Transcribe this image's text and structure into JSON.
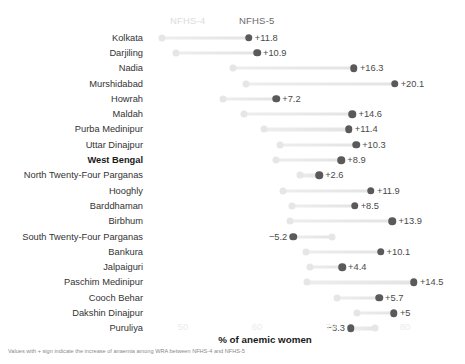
{
  "legend": {
    "nfhs4_label": "NFHS-4",
    "nfhs5_label": "NFHS-5",
    "nfhs4_color": "#e6e6e6",
    "nfhs5_color": "#5a5a5a"
  },
  "axis": {
    "title": "% of anemic women",
    "ticks": [
      "50",
      "60",
      "70",
      "80"
    ],
    "tick_values": [
      50,
      60,
      70,
      80
    ]
  },
  "footnote": "Values with + sign indicate the increase of anaemia among WRA between NFHS-4 and NFHS-5",
  "highlight_row": "West Bengal",
  "chart_data": {
    "type": "scatter",
    "subtype": "dumbbell",
    "title": "",
    "xlabel": "% of anemic women",
    "ylabel": "",
    "xlim": [
      42,
      86
    ],
    "grid": false,
    "legend_position": "top",
    "categories": [
      "Kolkata",
      "Darjiling",
      "Nadia",
      "Murshidabad",
      "Howrah",
      "Maldah",
      "Purba Medinipur",
      "Uttar Dinajpur",
      "West Bengal",
      "North Twenty-Four Parganas",
      "Hooghly",
      "Barddhaman",
      "Birbhum",
      "South Twenty-Four Parganas",
      "Bankura",
      "Jalpaiguri",
      "Paschim Medinipur",
      "Cooch Behar",
      "Dakshin Dinajpur",
      "Puruliya"
    ],
    "series": [
      {
        "name": "NFHS-4",
        "values": [
          47.1,
          49.1,
          56.8,
          58.5,
          55.4,
          58.3,
          61.0,
          63.1,
          62.5,
          65.8,
          63.5,
          64.7,
          64.4,
          70.1,
          66.6,
          67.1,
          66.7,
          70.8,
          73.5,
          76.0
        ]
      },
      {
        "name": "NFHS-5",
        "values": [
          58.9,
          60.0,
          73.1,
          78.6,
          62.6,
          72.9,
          72.4,
          73.4,
          71.4,
          68.4,
          75.4,
          73.2,
          78.3,
          64.9,
          76.7,
          71.5,
          81.2,
          76.5,
          78.5,
          72.7
        ]
      }
    ],
    "deltas": [
      "+11.8",
      "+10.9",
      "+16.3",
      "+20.1",
      "+7.2",
      "+14.6",
      "+11.4",
      "+10.3",
      "+8.9",
      "+2.6",
      "+11.9",
      "+8.5",
      "+13.9",
      "−5.2",
      "+10.1",
      "+4.4",
      "+14.5",
      "+5.7",
      "+5",
      "−3.3"
    ],
    "delta_values": [
      11.8,
      10.9,
      16.3,
      20.1,
      7.2,
      14.6,
      11.4,
      10.3,
      8.9,
      2.6,
      11.9,
      8.5,
      13.9,
      -5.2,
      10.1,
      4.4,
      14.5,
      5.7,
      5.0,
      -3.3
    ]
  }
}
